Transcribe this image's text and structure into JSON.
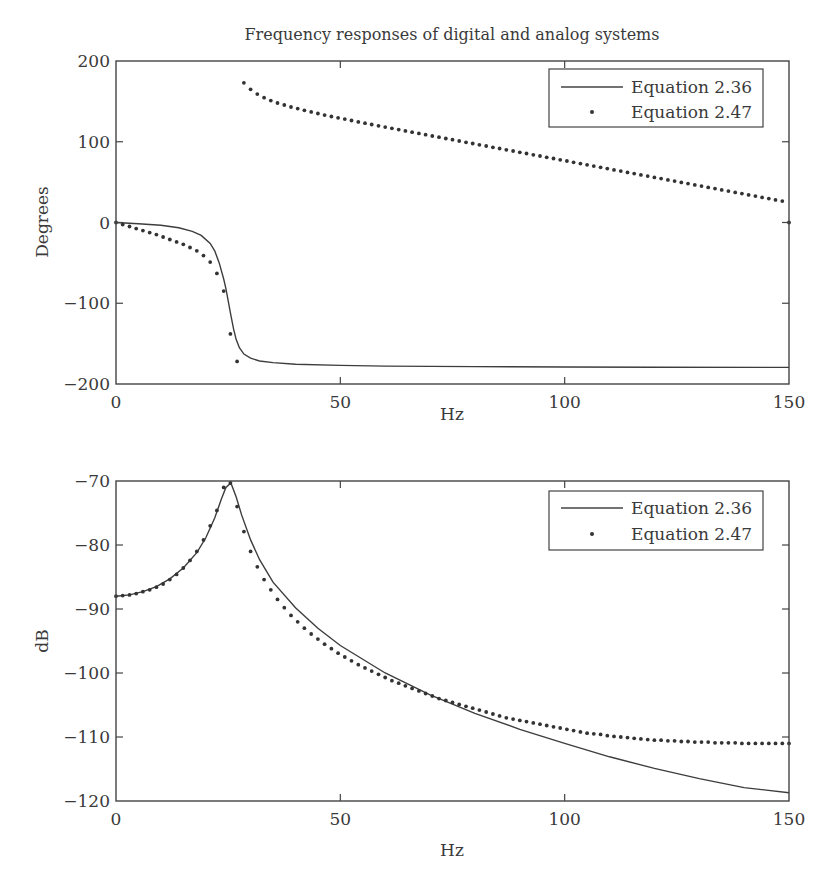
{
  "chart_data": [
    {
      "type": "line",
      "title": "Frequency responses of digital and analog systems",
      "xlabel": "Hz",
      "ylabel": "Degrees",
      "xlim": [
        0,
        150
      ],
      "ylim": [
        -200,
        200
      ],
      "xticks": [
        0,
        50,
        100,
        150
      ],
      "yticks": [
        -200,
        -100,
        0,
        100,
        200
      ],
      "grid": false,
      "legend_position": "upper right",
      "series": [
        {
          "name": "Equation 2.36",
          "style": "line",
          "x": [
            0,
            5,
            10,
            14,
            17,
            19,
            21,
            22,
            23,
            24,
            24.5,
            25,
            25.6,
            26.2,
            26.8,
            27.5,
            28.5,
            30,
            32,
            35,
            40,
            50,
            60,
            80,
            100,
            120,
            150
          ],
          "y": [
            0,
            -1.5,
            -3.5,
            -6.5,
            -11,
            -16,
            -26,
            -35,
            -50,
            -70,
            -82,
            -97,
            -115,
            -132,
            -145,
            -155,
            -163,
            -168,
            -171.5,
            -173.5,
            -175.5,
            -177,
            -177.8,
            -178.5,
            -178.9,
            -179.2,
            -179.5
          ]
        },
        {
          "name": "Equation 2.47",
          "style": "dots",
          "x": [
            0,
            1.5,
            3,
            4.5,
            6,
            7.5,
            9,
            10.5,
            12,
            13.5,
            15,
            16.5,
            18,
            19.5,
            21,
            22.5,
            24,
            25.5,
            27,
            28.5,
            30,
            31.5,
            33,
            34.5,
            36,
            37.5,
            39,
            40.5,
            42,
            43.5,
            45,
            46.5,
            48,
            49.5,
            51,
            52.5,
            54,
            55.5,
            57,
            58.5,
            60,
            61.5,
            63,
            64.5,
            66,
            67.5,
            69,
            70.5,
            72,
            73.5,
            75,
            76.5,
            78,
            79.5,
            81,
            82.5,
            84,
            85.5,
            87,
            88.5,
            90,
            91.5,
            93,
            94.5,
            96,
            97.5,
            99,
            100.5,
            102,
            103.5,
            105,
            106.5,
            108,
            109.5,
            111,
            112.5,
            114,
            115.5,
            117,
            118.5,
            120,
            121.5,
            123,
            124.5,
            126,
            127.5,
            129,
            130.5,
            132,
            133.5,
            135,
            136.5,
            138,
            139.5,
            141,
            142.5,
            144,
            145.5,
            147,
            148.5,
            150
          ],
          "y": [
            0,
            -2.5,
            -5,
            -7.5,
            -10,
            -12.5,
            -15,
            -18,
            -21,
            -24,
            -27,
            -31,
            -35,
            -41,
            -49,
            -63,
            -85,
            -138,
            -172,
            173,
            165,
            159,
            154.5,
            151,
            148,
            145.5,
            143,
            141,
            139,
            137,
            135,
            133,
            131.3,
            129.6,
            128,
            126.3,
            124.6,
            123,
            121.4,
            119.8,
            118.2,
            116.6,
            115,
            113.4,
            111.8,
            110.3,
            108.7,
            107.1,
            105.6,
            104,
            102.5,
            100.9,
            99.3,
            97.8,
            96.2,
            94.7,
            93.1,
            91.6,
            90,
            88.5,
            86.9,
            85.4,
            83.8,
            82.3,
            80.7,
            79.2,
            77.6,
            76.1,
            74.5,
            73,
            71.4,
            69.9,
            68.3,
            66.8,
            65.2,
            63.7,
            62.1,
            60.6,
            59,
            57.5,
            55.9,
            54.4,
            52.8,
            51.3,
            49.7,
            48.2,
            46.6,
            45.1,
            43.5,
            42,
            40.4,
            38.9,
            37.3,
            35.8,
            34.2,
            32.7,
            31.1,
            29.6,
            28,
            26.5,
            0
          ]
        }
      ]
    },
    {
      "type": "line",
      "title": "",
      "xlabel": "Hz",
      "ylabel": "dB",
      "xlim": [
        0,
        150
      ],
      "ylim": [
        -120,
        -70
      ],
      "xticks": [
        0,
        50,
        100,
        150
      ],
      "yticks": [
        -120,
        -110,
        -100,
        -90,
        -80,
        -70
      ],
      "grid": false,
      "legend_position": "upper right",
      "series": [
        {
          "name": "Equation 2.36",
          "style": "line",
          "x": [
            0,
            3,
            6,
            9,
            12,
            15,
            18,
            20,
            22,
            23.5,
            24.5,
            25.6,
            26.8,
            28,
            30,
            32,
            35,
            40,
            45,
            50,
            60,
            70,
            80,
            90,
            100,
            110,
            120,
            130,
            140,
            150
          ],
          "y": [
            -88,
            -87.8,
            -87.3,
            -86.5,
            -85.3,
            -83.6,
            -81.2,
            -78.9,
            -75.8,
            -72.8,
            -71,
            -70.3,
            -72.5,
            -75.3,
            -79.2,
            -82.3,
            -85.8,
            -89.8,
            -93,
            -95.7,
            -100,
            -103.4,
            -106.3,
            -108.8,
            -111,
            -113.1,
            -114.9,
            -116.5,
            -117.9,
            -118.7
          ]
        },
        {
          "name": "Equation 2.47",
          "style": "dots",
          "x": [
            0,
            1.5,
            3,
            4.5,
            6,
            7.5,
            9,
            10.5,
            12,
            13.5,
            15,
            16.5,
            18,
            19.5,
            21,
            22.5,
            24,
            25.5,
            27,
            28.5,
            30,
            31.5,
            33,
            34.5,
            36,
            37.5,
            39,
            40.5,
            42,
            43.5,
            45,
            46.5,
            48,
            49.5,
            51,
            52.5,
            54,
            55.5,
            57,
            58.5,
            60,
            61.5,
            63,
            64.5,
            66,
            67.5,
            69,
            70.5,
            72,
            73.5,
            75,
            76.5,
            78,
            79.5,
            81,
            82.5,
            84,
            85.5,
            87,
            88.5,
            90,
            91.5,
            93,
            94.5,
            96,
            97.5,
            99,
            100.5,
            102,
            103.5,
            105,
            106.5,
            108,
            109.5,
            111,
            112.5,
            114,
            115.5,
            117,
            118.5,
            120,
            121.5,
            123,
            124.5,
            126,
            127.5,
            129,
            130.5,
            132,
            133.5,
            135,
            136.5,
            138,
            139.5,
            141,
            142.5,
            144,
            145.5,
            147,
            148.5,
            150
          ],
          "y": [
            -88,
            -87.9,
            -87.8,
            -87.6,
            -87.3,
            -87,
            -86.6,
            -86.1,
            -85.4,
            -84.6,
            -83.6,
            -82.4,
            -81,
            -79.2,
            -77,
            -74.6,
            -71,
            -70.3,
            -74,
            -77.9,
            -81,
            -83.4,
            -85.4,
            -87,
            -88.5,
            -89.8,
            -91,
            -92,
            -93,
            -93.9,
            -94.7,
            -95.5,
            -96.2,
            -96.9,
            -97.5,
            -98.1,
            -98.7,
            -99.2,
            -99.7,
            -100.2,
            -100.7,
            -101.2,
            -101.6,
            -102,
            -102.4,
            -102.8,
            -103.2,
            -103.6,
            -104,
            -104.3,
            -104.6,
            -104.9,
            -105.2,
            -105.5,
            -105.8,
            -106.1,
            -106.4,
            -106.7,
            -107,
            -107.2,
            -107.4,
            -107.6,
            -107.8,
            -108,
            -108.2,
            -108.4,
            -108.6,
            -108.8,
            -109,
            -109.2,
            -109.4,
            -109.5,
            -109.6,
            -109.8,
            -109.9,
            -110,
            -110.1,
            -110.2,
            -110.3,
            -110.4,
            -110.5,
            -110.5,
            -110.6,
            -110.6,
            -110.7,
            -110.7,
            -110.8,
            -110.8,
            -110.8,
            -110.9,
            -110.9,
            -110.9,
            -110.9,
            -111,
            -111,
            -111,
            -111,
            -111,
            -111,
            -111,
            -111
          ]
        }
      ]
    }
  ],
  "figure": {
    "title": "Frequency responses of digital and analog systems",
    "legend_labels": [
      "Equation 2.36",
      "Equation 2.47"
    ]
  }
}
